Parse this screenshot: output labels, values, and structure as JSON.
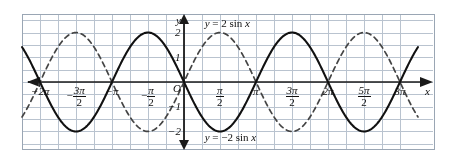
{
  "figure": {
    "background": "#ffffff",
    "grid_color": "#b9c3cf",
    "axis_color": "#1a1a1a",
    "curve_color": "#111111"
  },
  "axes": {
    "x_axis_name": "x",
    "y_axis_name": "y",
    "origin_label": "O",
    "x_ticks": [
      {
        "label": "-2π",
        "num": "",
        "den": "",
        "value": -6.2832,
        "style": "plain",
        "text": "−2π"
      },
      {
        "label": "-3π/2",
        "num": "3π",
        "den": "2",
        "value": -4.7124,
        "style": "fraction",
        "sign": "−"
      },
      {
        "label": "-π",
        "value": -3.1416,
        "style": "plain",
        "text": "−π"
      },
      {
        "label": "-π/2",
        "num": "π",
        "den": "2",
        "value": -1.5708,
        "style": "fraction",
        "sign": "−"
      },
      {
        "label": "π/2",
        "num": "π",
        "den": "2",
        "value": 1.5708,
        "style": "fraction",
        "sign": ""
      },
      {
        "label": "π",
        "value": 3.1416,
        "style": "plain",
        "text": "π"
      },
      {
        "label": "3π/2",
        "num": "3π",
        "den": "2",
        "value": 4.7124,
        "style": "fraction",
        "sign": ""
      },
      {
        "label": "2π",
        "value": 6.2832,
        "style": "plain",
        "text": "2π"
      },
      {
        "label": "5π/2",
        "num": "5π",
        "den": "2",
        "value": 7.854,
        "style": "fraction",
        "sign": ""
      },
      {
        "label": "3π",
        "value": 9.4248,
        "style": "plain",
        "text": "3π"
      }
    ],
    "y_ticks": [
      {
        "text": "2",
        "value": 2
      },
      {
        "text": "1",
        "value": 1
      },
      {
        "text": "−1",
        "value": -1
      },
      {
        "text": "−2",
        "value": -2
      }
    ]
  },
  "annotations": {
    "curve1_label": "y = 2 sin x",
    "curve2_label": "y = −2 sin x"
  },
  "chart_data": {
    "type": "line",
    "title": "",
    "xlabel": "x",
    "ylabel": "y",
    "xlim": [
      -7.0686,
      10.21
    ],
    "ylim": [
      -2.75,
      2.75
    ],
    "grid": true,
    "grid_step_x": 0.7854,
    "grid_step_y": 0.5,
    "legend": "inline-labels",
    "series": [
      {
        "name": "y = 2 sin x",
        "expression": "2*sin(x)",
        "amplitude": 2,
        "period": 6.2832,
        "linestyle": "dashed",
        "color": "#444444",
        "label_position": "upper-right",
        "x": [
          -7.0686,
          -6.2832,
          -5.4978,
          -4.7124,
          -3.927,
          -3.1416,
          -2.3562,
          -1.5708,
          -0.7854,
          0,
          0.7854,
          1.5708,
          2.3562,
          3.1416,
          3.927,
          4.7124,
          5.4978,
          6.2832,
          7.0686,
          7.854,
          8.6394,
          9.4248,
          10.21
        ],
        "y": [
          -1.414,
          0,
          1.414,
          2,
          1.414,
          0,
          -1.414,
          -2,
          -1.414,
          0,
          1.414,
          2,
          1.414,
          0,
          -1.414,
          -2,
          -1.414,
          0,
          1.414,
          2,
          1.414,
          0,
          -1.414
        ]
      },
      {
        "name": "y = -2 sin x",
        "expression": "-2*sin(x)",
        "amplitude": 2,
        "period": 6.2832,
        "linestyle": "solid",
        "color": "#111111",
        "label_position": "lower-right",
        "x": [
          -7.0686,
          -6.2832,
          -5.4978,
          -4.7124,
          -3.927,
          -3.1416,
          -2.3562,
          -1.5708,
          -0.7854,
          0,
          0.7854,
          1.5708,
          2.3562,
          3.1416,
          3.927,
          4.7124,
          5.4978,
          6.2832,
          7.0686,
          7.854,
          8.6394,
          9.4248,
          10.21
        ],
        "y": [
          1.414,
          0,
          -1.414,
          -2,
          -1.414,
          0,
          1.414,
          2,
          1.414,
          0,
          -1.414,
          -2,
          -1.414,
          0,
          1.414,
          2,
          1.414,
          0,
          -1.414,
          -2,
          -1.414,
          0,
          1.414
        ]
      }
    ]
  }
}
